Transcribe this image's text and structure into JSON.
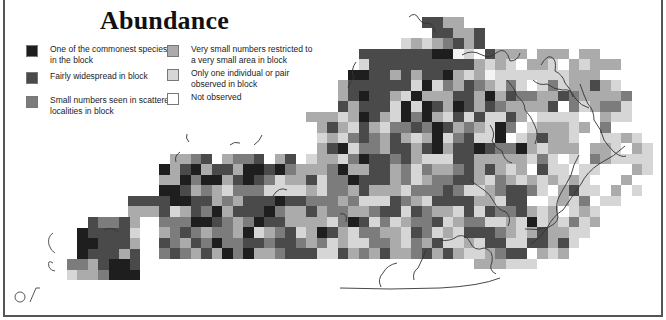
{
  "title": "Abundance",
  "legend": [
    {
      "level": 6,
      "label": "One of the commonest species in the block",
      "color": "#1e1e1e"
    },
    {
      "level": 5,
      "label": "Fairly widespread in block",
      "color": "#4a4a4a"
    },
    {
      "level": 4,
      "label": "Small numbers seen in scattered localities in block",
      "color": "#7c7c7c"
    },
    {
      "level": 3,
      "label": "Very small numbers restricted to a very small area in block",
      "color": "#ababab"
    },
    {
      "level": 2,
      "label": "Only one individual or pair observed in block",
      "color": "#d6d6d6"
    },
    {
      "level": 1,
      "label": "Not observed",
      "color": "#ffffff"
    }
  ],
  "map": {
    "cell_size": 10.5,
    "origin_x": 33,
    "origin_y": 17,
    "colors": {
      "0": "transparent",
      "1": "#f4f4f4",
      "2": "#d6d6d6",
      "3": "#ababab",
      "4": "#7c7c7c",
      "5": "#4a4a4a",
      "6": "#1e1e1e"
    },
    "rows": [
      "0000000000000000000000000000000000055330000000000000000000",
      "0000000000000000000000000000000000005533500000000000000000",
      "0000000000000000000000000000000002323453500000000000000000",
      "0000000000000000000000000000055555556612053330333033000000",
      "0000000000000000000000000000025555555555323203320323330000",
      "0000000000000000000000000000665535355632312222222333000000",
      "0000000000000000000000000003555555262435432420242335320000",
      "0000000000000000000000000003565532633355363544335433334000",
      "0000000000000000000000000005355526265365354333350423442000",
      "0000000000000000000000003332365326463252522530222200322000",
      "0000000000000000000000000353253244546534326402333230400000",
      "0000000000000000000000000232454353236245226023533200223200",
      "0000000000000000000000000356244355356355654463233303320320",
      "0000000000033450344503502332465545322255333332420204322220",
      "0000000000635635536656433346335534243345353230522022000320",
      "0000000000336466356542335244655534234455324323232320003000",
      "0000000000665343244422223244353332444542234554203522030200",
      "0000000555566553435556554443422254325555332550023240220000",
      "0000000333523546355564335344334552543325254453230232000000",
      "0000000000444665434655333324652423445234422326232423000000",
      "0000000000345434436234523653244332542325554323533220000000",
      "0000000000543546445545543423224432435223255225535200000000",
      "0000000000454353646334555225343533453532234550323000000000",
      "0000000000000000000000000000000000000000333222000000000000",
      "0000000000000000000000000000000000000000000000000000000000",
      "0000000000000000000000000000000000000000000000000000000000",
      "0000000000000000000000000000000000000000000000000000000000"
    ],
    "west_rows": [
      "00000005445300000000",
      "00000065555200000000",
      "00000066555300000000",
      "00000065553500000000",
      "00000443566500000000",
      "00000233466600000000"
    ],
    "west_origin_y": 217
  }
}
